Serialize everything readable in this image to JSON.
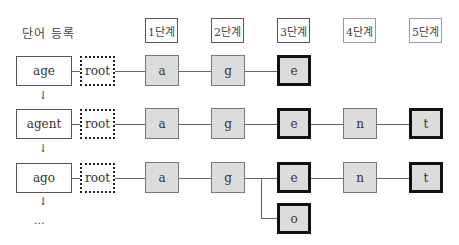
{
  "title": "단어 등록",
  "stages": [
    "1단계",
    "2단계",
    "3단계",
    "4단계",
    "5단계"
  ],
  "root_label": "root",
  "rows": [
    {
      "word": "age",
      "nodes": [
        "a",
        "g",
        "e"
      ],
      "end_index": 2
    },
    {
      "word": "agent",
      "nodes": [
        "a",
        "g",
        "e",
        "n",
        "t"
      ],
      "end_indices": [
        2,
        4
      ]
    },
    {
      "word": "ago",
      "nodes": [
        "a",
        "g",
        "e",
        "n",
        "t"
      ],
      "end_indices": [
        2,
        4
      ],
      "branch": {
        "label": "o",
        "from_stage": 2,
        "stage": 3
      }
    }
  ],
  "down_arrow": "↓",
  "ellipsis": "..."
}
